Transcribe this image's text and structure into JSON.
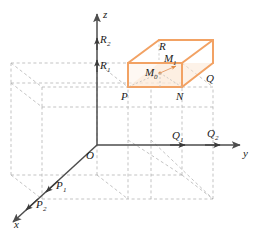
{
  "figure": {
    "colors": {
      "axis": "#4d4d4d",
      "dashed_grid": "#b3b3b3",
      "box_orange": "#f2a264",
      "box_fill": "#fdf0e3",
      "thin_line": "#9a9a9a",
      "label_text": "#1a1a1a",
      "background": "#ffffff"
    },
    "axes": {
      "z_label": "z",
      "y_label": "y",
      "x_label": "x",
      "origin_label": "O"
    },
    "axis_markers": {
      "z": [
        {
          "base": "R",
          "sub": "1"
        },
        {
          "base": "R",
          "sub": "2"
        }
      ],
      "y": [
        {
          "base": "Q",
          "sub": "1"
        },
        {
          "base": "Q",
          "sub": "2"
        }
      ],
      "x": [
        {
          "base": "P",
          "sub": "1"
        },
        {
          "base": "P",
          "sub": "2"
        }
      ]
    },
    "box_vertices": [
      {
        "base": "R",
        "sub": ""
      },
      {
        "base": "Q",
        "sub": ""
      },
      {
        "base": "P",
        "sub": ""
      },
      {
        "base": "N",
        "sub": ""
      }
    ],
    "interior_points": [
      {
        "base": "M",
        "sub": "0"
      },
      {
        "base": "M",
        "sub": "1"
      }
    ]
  }
}
